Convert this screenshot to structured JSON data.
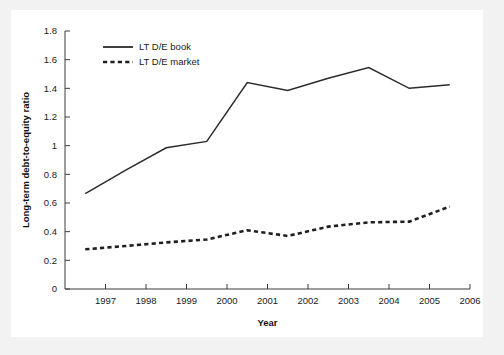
{
  "chart_data": {
    "type": "line",
    "title": "",
    "subtitle": "",
    "xlabel": "Year",
    "ylabel": "Long-term debt-to-equity ratio",
    "xlim": [
      1996,
      2006
    ],
    "ylim": [
      0,
      1.8
    ],
    "grid": false,
    "legend_position": "upper-left",
    "x_tick_labels": [
      "1997",
      "1998",
      "1999",
      "2000",
      "2001",
      "2002",
      "2003",
      "2004",
      "2005",
      "2006"
    ],
    "x_ticks": [
      1997,
      1998,
      1999,
      2000,
      2001,
      2002,
      2003,
      2004,
      2005,
      2006
    ],
    "y_tick_labels": [
      "0",
      "0.2",
      "0.4",
      "0.6",
      "0.8",
      "1",
      "1.2",
      "1.4",
      "1.6",
      "1.8"
    ],
    "y_ticks": [
      0,
      0.2,
      0.4,
      0.6,
      0.8,
      1.0,
      1.2,
      1.4,
      1.6,
      1.8
    ],
    "x": [
      1996.5,
      1997.5,
      1998.5,
      1999.5,
      2000.5,
      2001.5,
      2002.5,
      2003.5,
      2004.5,
      2005.5
    ],
    "series": [
      {
        "name": "LT D/E book",
        "style": "solid",
        "color": "#2b2b2b",
        "values": [
          0.665,
          0.83,
          0.985,
          1.03,
          1.44,
          1.385,
          1.47,
          1.545,
          1.4,
          1.425
        ]
      },
      {
        "name": "LT D/E market",
        "style": "dashed",
        "color": "#1f1f1f",
        "values": [
          0.277,
          0.3,
          0.325,
          0.345,
          0.41,
          0.37,
          0.435,
          0.465,
          0.47,
          0.575
        ]
      }
    ]
  },
  "legend": {
    "items": [
      {
        "label": "LT D/E book",
        "style": "solid"
      },
      {
        "label": "LT D/E market",
        "style": "dashed"
      }
    ]
  }
}
